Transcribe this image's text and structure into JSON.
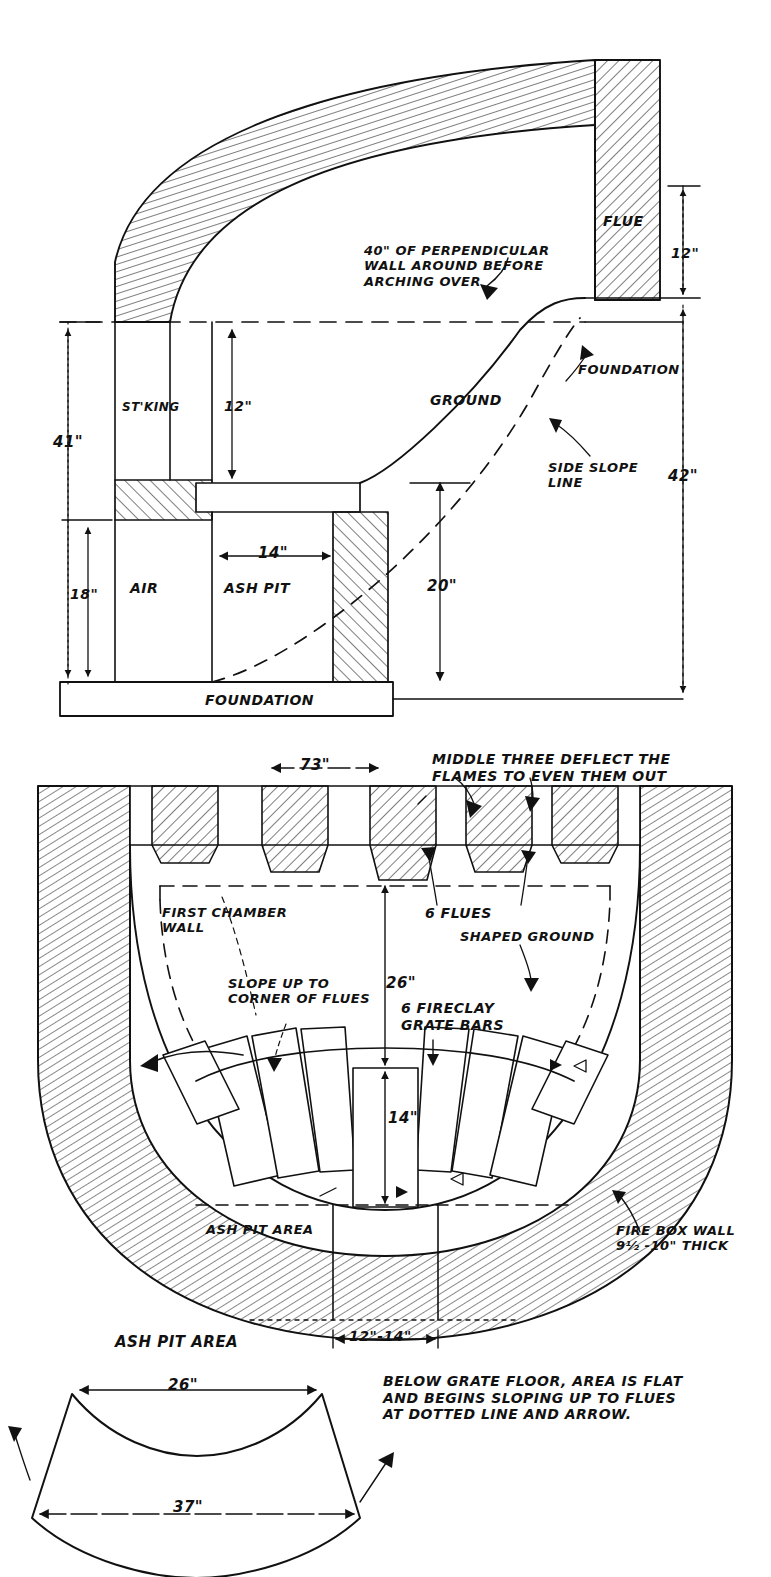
{
  "document": {
    "title": "Firebox / Ash Pit Construction Drawing",
    "type": "hand-drawn technical section drawing",
    "ink_color": "#111111",
    "paper_color": "#ffffff"
  },
  "views": {
    "section_elevation": {
      "name": "Vertical Section Elevation",
      "labels": {
        "arch_note": "40\" OF PERPENDICULAR\nWALL AROUND BEFORE\nARCHING OVER",
        "flue": "FLUE",
        "ground": "GROUND",
        "foundation_right": "FOUNDATION",
        "side_slope_line": "SIDE SLOPE\nLINE",
        "stoking": "ST'KING",
        "air": "AIR",
        "ash_pit": "ASH PIT",
        "foundation_bottom": "FOUNDATION"
      },
      "dimensions": {
        "overall_height": "41\"",
        "stoking_height": "12\"",
        "air_height": "18\"",
        "ash_pit_width": "14\"",
        "flue_height": "12\"",
        "ground_to_foundation": "42\"",
        "ash_pit_depth": "20\""
      }
    },
    "plan_section": {
      "name": "Plan Section Through Firebox",
      "labels": {
        "deflect_note": "MIDDLE THREE DEFLECT THE\nFLAMES TO EVEN THEM OUT",
        "first_chamber_wall": "FIRST CHAMBER\nWALL",
        "six_flues": "6 FLUES",
        "shaped_ground": "SHAPED GROUND",
        "slope_up": "SLOPE UP TO\nCORNER OF FLUES",
        "grate_bars": "6 FIRECLAY\nGRATE BARS",
        "ash_pit_area": "ASH PIT AREA",
        "fire_box_wall": "FIRE BOX WALL\n9½ -10\" THICK"
      },
      "dimensions": {
        "flue_pitch": "73\"",
        "chamber_to_grate": "26\"",
        "grate_to_pit": "14\"",
        "pit_opening": "12\"-14\""
      }
    },
    "ash_pit_detail": {
      "name": "Ash Pit Area Detail",
      "title": "ASH PIT AREA",
      "dimensions": {
        "top_width": "26\"",
        "bottom_width": "37\""
      },
      "note": "BELOW GRATE FLOOR, AREA IS FLAT\nAND BEGINS SLOPING UP TO FLUES\nAT DOTTED LINE AND ARROW."
    }
  }
}
